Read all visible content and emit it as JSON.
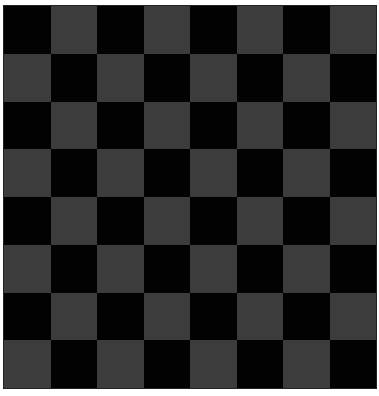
{
  "board": {
    "rows": 8,
    "cols": 8,
    "top_left": "dark",
    "colors": {
      "dark": "#020202",
      "light": "#3c3c3c"
    }
  }
}
